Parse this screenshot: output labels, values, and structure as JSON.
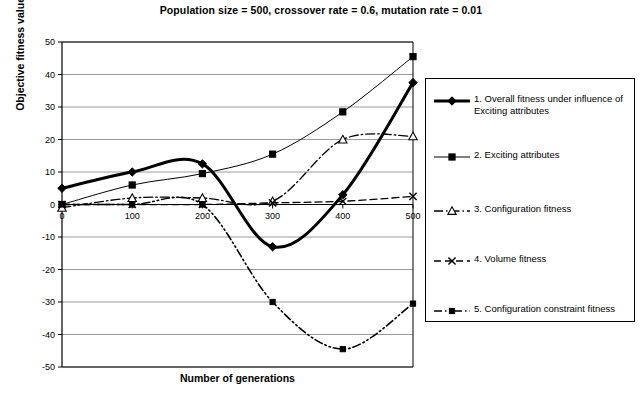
{
  "chart_data": {
    "type": "line",
    "title": "Population size = 500, crossover rate = 0.6, mutation rate = 0.01",
    "xlabel": "Number of generations",
    "ylabel": "Objective fitness values",
    "x": [
      0,
      100,
      200,
      300,
      400,
      500
    ],
    "xtick_labels": [
      "0",
      "100",
      "200",
      "300",
      "400",
      "500"
    ],
    "ytick_labels": [
      "50",
      "40",
      "30",
      "20",
      "10",
      "0",
      "-10",
      "-20",
      "-30",
      "-40",
      "-50"
    ],
    "ytick_values": [
      50,
      40,
      30,
      20,
      10,
      0,
      -10,
      -20,
      -30,
      -40,
      -50
    ],
    "xlim": [
      0,
      500
    ],
    "ylim": [
      -50,
      50
    ],
    "grid": "horizontal",
    "legend_position": "right",
    "series": [
      {
        "name": "1. Overall fitness under influence of Exciting attributes",
        "marker": "diamond",
        "line_style": "solid",
        "line_width": 3,
        "values": [
          5,
          10,
          12.5,
          -13,
          3,
          37.5
        ]
      },
      {
        "name": "2. Exciting attributes",
        "marker": "square",
        "line_style": "solid",
        "line_width": 1,
        "values": [
          0,
          6,
          9.5,
          15.5,
          28.5,
          45.5
        ]
      },
      {
        "name": "3. Configuration fitness",
        "marker": "triangle",
        "line_style": "dash-dot",
        "line_width": 1.3,
        "values": [
          -1,
          2,
          2,
          1,
          20,
          21
        ]
      },
      {
        "name": "4. Volume fitness",
        "marker": "cross",
        "line_style": "dashed",
        "line_width": 1.3,
        "values": [
          0,
          0,
          0,
          0.5,
          1,
          2.5
        ]
      },
      {
        "name": "5. Configuration constraint fitness",
        "marker": "square-small",
        "line_style": "dash-dot-dot",
        "line_width": 1.6,
        "values": [
          0,
          0,
          0,
          -30,
          -44.5,
          -30.5
        ]
      }
    ]
  },
  "legend": {
    "entries": [
      {
        "label": "1. Overall fitness under influence of Exciting attributes"
      },
      {
        "label": "2. Exciting attributes"
      },
      {
        "label": "3. Configuration fitness"
      },
      {
        "label": "4. Volume fitness"
      },
      {
        "label": "5. Configuration constraint fitness"
      }
    ]
  },
  "colors": {
    "line": "#000000",
    "grid": "#808080",
    "axis": "#000000",
    "background": "#ffffff"
  }
}
